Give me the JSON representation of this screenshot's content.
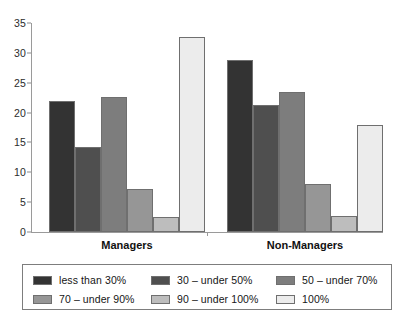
{
  "chart_data": {
    "type": "bar",
    "title": "",
    "subtitle": "",
    "xlabel": "",
    "ylabel": "",
    "categories": [
      "Managers",
      "Non-Managers"
    ],
    "ylim": [
      0,
      35
    ],
    "y_ticks": [
      0,
      5,
      10,
      15,
      20,
      25,
      30,
      35
    ],
    "grid": false,
    "legend_position": "bottom",
    "series": [
      {
        "name": "less than 30%",
        "color": "#333333",
        "values": [
          22.0,
          28.8
        ]
      },
      {
        "name": "30 – under 50%",
        "color": "#4f4f4f",
        "values": [
          14.3,
          21.2
        ]
      },
      {
        "name": "50 – under 70%",
        "color": "#7d7d7d",
        "values": [
          22.6,
          23.4
        ]
      },
      {
        "name": "70 – under 90%",
        "color": "#969696",
        "values": [
          7.2,
          8.1
        ]
      },
      {
        "name": "90 – under 100%",
        "color": "#bdbdbd",
        "values": [
          2.5,
          2.7
        ]
      },
      {
        "name": "100%",
        "color": "#ececec",
        "values": [
          32.6,
          18.0
        ]
      }
    ]
  },
  "axis": {
    "y_tick_labels": [
      "0",
      "5",
      "10",
      "15",
      "20",
      "25",
      "30",
      "35"
    ]
  },
  "groups": [
    {
      "label": "Managers"
    },
    {
      "label": "Non-Managers"
    }
  ],
  "legend": {
    "items": [
      {
        "label": "less than 30%",
        "color": "#333333"
      },
      {
        "label": "30 – under 50%",
        "color": "#4f4f4f"
      },
      {
        "label": "50 – under 70%",
        "color": "#7d7d7d"
      },
      {
        "label": "70 – under 90%",
        "color": "#969696"
      },
      {
        "label": "90 – under 100%",
        "color": "#bdbdbd"
      },
      {
        "label": "100%",
        "color": "#ececec"
      }
    ]
  }
}
